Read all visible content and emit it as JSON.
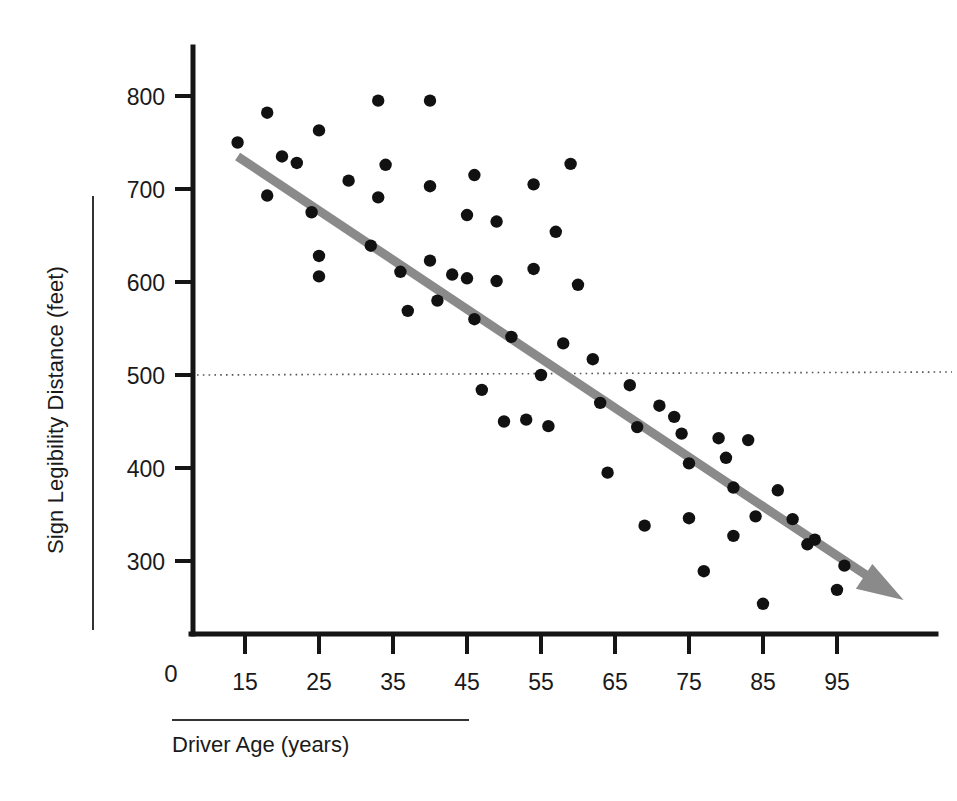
{
  "chart_data": {
    "type": "scatter",
    "title": "",
    "xlabel": "Driver Age (years)",
    "ylabel": "Sign Legibility Distance (feet)",
    "xlim": [
      5,
      108
    ],
    "ylim": [
      200,
      830
    ],
    "xticks": [
      15,
      25,
      35,
      45,
      55,
      65,
      75,
      85,
      95
    ],
    "xtick_labels": [
      "15",
      "25",
      "35",
      "45",
      "55",
      "65",
      "75",
      "85",
      "95"
    ],
    "yticks": [
      300,
      400,
      500,
      600,
      700,
      800
    ],
    "ytick_labels": [
      "300",
      "400",
      "500",
      "600",
      "700",
      "800"
    ],
    "origin_label": "0",
    "grid": false,
    "legend": null,
    "reference_line": {
      "orientation": "horizontal",
      "value": 500,
      "style": "dotted",
      "label": ""
    },
    "trendline": {
      "style": "solid-arrow",
      "color": "#8a8a8a",
      "x_start": 14,
      "y_start": 735,
      "x_end": 104,
      "y_end": 258,
      "arrow": true
    },
    "points": [
      {
        "x": 14,
        "y": 750
      },
      {
        "x": 18,
        "y": 782
      },
      {
        "x": 18,
        "y": 693
      },
      {
        "x": 20,
        "y": 735
      },
      {
        "x": 22,
        "y": 728
      },
      {
        "x": 24,
        "y": 675
      },
      {
        "x": 25,
        "y": 763
      },
      {
        "x": 25,
        "y": 628
      },
      {
        "x": 25,
        "y": 606
      },
      {
        "x": 29,
        "y": 709
      },
      {
        "x": 32,
        "y": 639
      },
      {
        "x": 33,
        "y": 795
      },
      {
        "x": 33,
        "y": 691
      },
      {
        "x": 34,
        "y": 726
      },
      {
        "x": 36,
        "y": 611
      },
      {
        "x": 37,
        "y": 569
      },
      {
        "x": 40,
        "y": 795
      },
      {
        "x": 40,
        "y": 703
      },
      {
        "x": 40,
        "y": 623
      },
      {
        "x": 41,
        "y": 580
      },
      {
        "x": 43,
        "y": 608
      },
      {
        "x": 45,
        "y": 672
      },
      {
        "x": 45,
        "y": 604
      },
      {
        "x": 46,
        "y": 715
      },
      {
        "x": 46,
        "y": 560
      },
      {
        "x": 47,
        "y": 484
      },
      {
        "x": 49,
        "y": 665
      },
      {
        "x": 49,
        "y": 601
      },
      {
        "x": 50,
        "y": 450
      },
      {
        "x": 51,
        "y": 541
      },
      {
        "x": 53,
        "y": 452
      },
      {
        "x": 54,
        "y": 705
      },
      {
        "x": 54,
        "y": 614
      },
      {
        "x": 55,
        "y": 500
      },
      {
        "x": 56,
        "y": 445
      },
      {
        "x": 57,
        "y": 654
      },
      {
        "x": 58,
        "y": 534
      },
      {
        "x": 59,
        "y": 727
      },
      {
        "x": 60,
        "y": 597
      },
      {
        "x": 62,
        "y": 517
      },
      {
        "x": 63,
        "y": 470
      },
      {
        "x": 64,
        "y": 395
      },
      {
        "x": 67,
        "y": 489
      },
      {
        "x": 68,
        "y": 444
      },
      {
        "x": 69,
        "y": 338
      },
      {
        "x": 71,
        "y": 467
      },
      {
        "x": 73,
        "y": 455
      },
      {
        "x": 74,
        "y": 437
      },
      {
        "x": 75,
        "y": 405
      },
      {
        "x": 75,
        "y": 346
      },
      {
        "x": 77,
        "y": 289
      },
      {
        "x": 79,
        "y": 432
      },
      {
        "x": 80,
        "y": 411
      },
      {
        "x": 81,
        "y": 379
      },
      {
        "x": 81,
        "y": 327
      },
      {
        "x": 83,
        "y": 430
      },
      {
        "x": 84,
        "y": 348
      },
      {
        "x": 85,
        "y": 254
      },
      {
        "x": 87,
        "y": 376
      },
      {
        "x": 89,
        "y": 345
      },
      {
        "x": 91,
        "y": 318
      },
      {
        "x": 92,
        "y": 323
      },
      {
        "x": 95,
        "y": 269
      },
      {
        "x": 96,
        "y": 295
      }
    ]
  }
}
